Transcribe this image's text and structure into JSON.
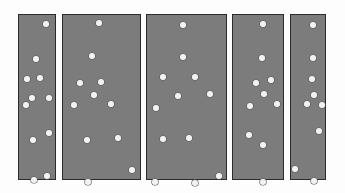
{
  "figure": {
    "width": 345,
    "height": 193,
    "background_color": "#fdfdfd",
    "panel_fill_color": "#7c7c7c",
    "panel_border_color": "#2b2b2b",
    "dot_color": "#f2f2f2",
    "dot_diameter": 5.4,
    "panel_count": 5,
    "total_dot_count": 52
  },
  "chart_data": {
    "type": "scatter",
    "xlabel": "",
    "ylabel": "",
    "grid": false,
    "legend": "none",
    "xlim": [
      0,
      345
    ],
    "ylim": [
      0,
      193
    ],
    "note": "Coordinates are in screenshot pixels, origin at top-left. Each panel is a separate scatter region.",
    "series": [
      {
        "name": "panel-1",
        "panel_index": 1,
        "panel_rect": {
          "x": 18,
          "y": 14,
          "width": 38,
          "height": 166
        },
        "count": 11,
        "points": [
          {
            "x": 45,
            "y": 23
          },
          {
            "x": 35,
            "y": 58
          },
          {
            "x": 26,
            "y": 78
          },
          {
            "x": 39,
            "y": 77
          },
          {
            "x": 31,
            "y": 97
          },
          {
            "x": 48,
            "y": 97
          },
          {
            "x": 25,
            "y": 104
          },
          {
            "x": 48,
            "y": 132
          },
          {
            "x": 32,
            "y": 139
          },
          {
            "x": 46,
            "y": 175
          },
          {
            "x": 33,
            "y": 179
          }
        ]
      },
      {
        "name": "panel-2",
        "panel_index": 2,
        "panel_rect": {
          "x": 62,
          "y": 14,
          "width": 79,
          "height": 166
        },
        "count": 10,
        "points": [
          {
            "x": 98,
            "y": 22
          },
          {
            "x": 91,
            "y": 55
          },
          {
            "x": 79,
            "y": 82
          },
          {
            "x": 100,
            "y": 81
          },
          {
            "x": 93,
            "y": 94
          },
          {
            "x": 73,
            "y": 104
          },
          {
            "x": 110,
            "y": 103
          },
          {
            "x": 86,
            "y": 139
          },
          {
            "x": 117,
            "y": 137
          },
          {
            "x": 131,
            "y": 169
          },
          {
            "x": 87,
            "y": 181
          }
        ]
      },
      {
        "name": "panel-3",
        "panel_index": 3,
        "panel_rect": {
          "x": 146,
          "y": 14,
          "width": 81,
          "height": 166
        },
        "count": 11,
        "points": [
          {
            "x": 182,
            "y": 24
          },
          {
            "x": 182,
            "y": 56
          },
          {
            "x": 162,
            "y": 76
          },
          {
            "x": 194,
            "y": 76
          },
          {
            "x": 177,
            "y": 95
          },
          {
            "x": 209,
            "y": 93
          },
          {
            "x": 155,
            "y": 107
          },
          {
            "x": 162,
            "y": 138
          },
          {
            "x": 188,
            "y": 137
          },
          {
            "x": 218,
            "y": 175
          },
          {
            "x": 154,
            "y": 181
          },
          {
            "x": 194,
            "y": 182
          }
        ]
      },
      {
        "name": "panel-4",
        "panel_index": 4,
        "panel_rect": {
          "x": 232,
          "y": 14,
          "width": 52,
          "height": 166
        },
        "count": 10,
        "points": [
          {
            "x": 262,
            "y": 23
          },
          {
            "x": 261,
            "y": 57
          },
          {
            "x": 255,
            "y": 82
          },
          {
            "x": 270,
            "y": 79
          },
          {
            "x": 263,
            "y": 93
          },
          {
            "x": 249,
            "y": 105
          },
          {
            "x": 276,
            "y": 103
          },
          {
            "x": 248,
            "y": 134
          },
          {
            "x": 262,
            "y": 144
          },
          {
            "x": 262,
            "y": 181
          }
        ]
      },
      {
        "name": "panel-5",
        "panel_index": 5,
        "panel_rect": {
          "x": 290,
          "y": 14,
          "width": 36,
          "height": 166
        },
        "count": 10,
        "points": [
          {
            "x": 312,
            "y": 24
          },
          {
            "x": 312,
            "y": 57
          },
          {
            "x": 311,
            "y": 78
          },
          {
            "x": 313,
            "y": 94
          },
          {
            "x": 306,
            "y": 103
          },
          {
            "x": 321,
            "y": 104
          },
          {
            "x": 318,
            "y": 130
          },
          {
            "x": 294,
            "y": 168
          },
          {
            "x": 313,
            "y": 180
          }
        ]
      }
    ]
  }
}
